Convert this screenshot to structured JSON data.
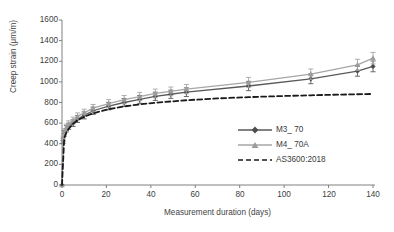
{
  "chart_data": {
    "type": "line",
    "title": "",
    "xlabel": "Measurement duration (days)",
    "ylabel": "Creep strain (μm/m)",
    "xlim": [
      0,
      140
    ],
    "ylim": [
      0,
      1600
    ],
    "xticks": [
      0,
      20,
      40,
      60,
      80,
      100,
      120,
      140
    ],
    "yticks": [
      0,
      200,
      400,
      600,
      800,
      1000,
      1200,
      1400,
      1600
    ],
    "grid": false,
    "legend_position": "inside-lower-right",
    "series": [
      {
        "name": "M3_ 70",
        "color": "#595959",
        "marker": "diamond",
        "style": "solid",
        "error_bars": true,
        "x": [
          0,
          0.5,
          1,
          2,
          3,
          5,
          7,
          10,
          14,
          21,
          28,
          35,
          42,
          49,
          56,
          84,
          112,
          133,
          140
        ],
        "y": [
          0,
          430,
          500,
          545,
          570,
          600,
          640,
          675,
          720,
          765,
          800,
          830,
          860,
          880,
          900,
          960,
          1030,
          1105,
          1150
        ],
        "yerr": [
          0,
          25,
          28,
          30,
          30,
          32,
          33,
          34,
          35,
          36,
          38,
          38,
          40,
          40,
          42,
          45,
          48,
          50,
          52
        ]
      },
      {
        "name": "M4_ 70A",
        "color": "#a6a6a6",
        "marker": "triangle",
        "style": "solid",
        "error_bars": true,
        "x": [
          0,
          0.5,
          1,
          2,
          3,
          5,
          7,
          10,
          14,
          21,
          28,
          35,
          42,
          49,
          56,
          84,
          112,
          133,
          140
        ],
        "y": [
          0,
          450,
          520,
          560,
          590,
          625,
          665,
          700,
          745,
          790,
          828,
          858,
          888,
          908,
          930,
          995,
          1075,
          1165,
          1230
        ],
        "yerr": [
          0,
          26,
          28,
          30,
          32,
          33,
          34,
          35,
          36,
          38,
          40,
          40,
          42,
          42,
          44,
          48,
          50,
          54,
          56
        ]
      },
      {
        "name": "AS3600:2018",
        "color": "#1a1a1a",
        "marker": "none",
        "style": "dashed",
        "error_bars": false,
        "x": [
          0,
          1,
          2,
          3,
          5,
          7,
          10,
          14,
          21,
          28,
          35,
          42,
          56,
          70,
          84,
          98,
          112,
          126,
          140
        ],
        "y": [
          0,
          455,
          510,
          545,
          595,
          628,
          662,
          695,
          735,
          762,
          782,
          798,
          822,
          840,
          852,
          862,
          870,
          877,
          883
        ],
        "yerr": []
      }
    ]
  },
  "legend": {
    "items": [
      {
        "label": "M3_ 70"
      },
      {
        "label": "M4_ 70A"
      },
      {
        "label": "AS3600:2018"
      }
    ]
  },
  "axes": {
    "y_label": "Creep strain (μm/m)",
    "x_label": "Measurement duration (days)",
    "y_tick_labels": [
      "1600",
      "1400",
      "1200",
      "1000",
      "800",
      "600",
      "400",
      "200",
      "0"
    ],
    "x_tick_labels": [
      "0",
      "20",
      "40",
      "60",
      "80",
      "100",
      "120",
      "140"
    ]
  }
}
